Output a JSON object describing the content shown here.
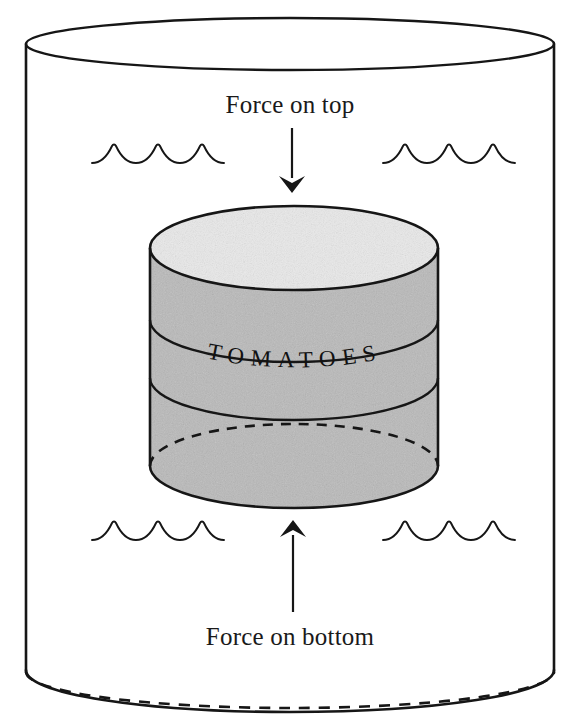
{
  "figure": {
    "background_color": "#ffffff",
    "ink_color": "#161616"
  },
  "container": {
    "name": "water-tank",
    "shape": "open cylinder seen in perspective",
    "water_label": "water surface ripples"
  },
  "can": {
    "product_label": "TOMATOES",
    "body_color": "#b8b8b8",
    "lid_color": "#e6e6e6",
    "shape": "cylinder"
  },
  "labels": {
    "force_top": "Force on top",
    "force_bottom": "Force on bottom"
  },
  "arrows": {
    "top": {
      "direction": "down",
      "name": "force-on-top-arrow"
    },
    "bottom": {
      "direction": "up",
      "name": "force-on-bottom-arrow"
    }
  },
  "waves": {
    "count": 4,
    "positions": [
      "upper-left",
      "upper-right",
      "lower-left",
      "lower-right"
    ],
    "scallops_per_group": 3
  }
}
